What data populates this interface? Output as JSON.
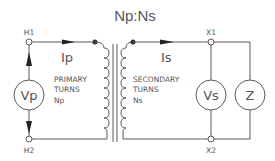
{
  "title": "Np:Ns",
  "terminals": {
    "h1": "H1",
    "h2": "H2",
    "x1": "X1",
    "x2": "X2"
  },
  "currents": {
    "primary": "Ip",
    "secondary": "Is"
  },
  "primary": {
    "line1": "PRIMARY",
    "line2": "TURNS",
    "line3": "Np"
  },
  "secondary": {
    "line1": "SECONDARY",
    "line2": "TURNS",
    "line3": "Ns"
  },
  "sources": {
    "primary_voltage": "Vp",
    "secondary_voltage": "Vs",
    "load": "Z"
  },
  "colors": {
    "line": "#5a5a5a",
    "text": "#555555",
    "background": "#ffffff"
  }
}
